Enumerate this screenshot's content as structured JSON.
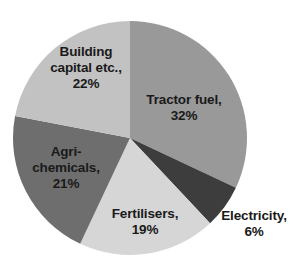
{
  "chart_data": {
    "type": "pie",
    "title": "",
    "subtitle": "",
    "xlabel": "",
    "ylabel": "",
    "legend_position": "none",
    "grid": false,
    "units": "percent",
    "start_angle_deg": 0,
    "direction": "clockwise",
    "categories": [
      "Tractor fuel",
      "Electricity",
      "Fertilisers",
      "Agri-chemicals",
      "Building capital etc."
    ],
    "values": [
      32,
      6,
      19,
      21,
      22
    ],
    "total": 100,
    "slices": [
      {
        "name": "tractor-fuel",
        "label_text": "Tractor fuel,\n32%",
        "category": "Tractor fuel",
        "value": 32,
        "value_text": "32%",
        "color": "#999999",
        "start_deg": 0,
        "end_deg": 115.2,
        "label_inside": true
      },
      {
        "name": "electricity",
        "label_text": "Electricity,\n6%",
        "category": "Electricity",
        "value": 6,
        "value_text": "6%",
        "color": "#3d3d3d",
        "start_deg": 115.2,
        "end_deg": 136.8,
        "label_inside": false
      },
      {
        "name": "fertilisers",
        "label_text": "Fertilisers,\n19%",
        "category": "Fertilisers",
        "value": 19,
        "value_text": "19%",
        "color": "#d6d6d6",
        "start_deg": 136.8,
        "end_deg": 205.2,
        "label_inside": true
      },
      {
        "name": "agri-chemicals",
        "label_text": "Agri-\nchemicals,\n21%",
        "category": "Agri-chemicals",
        "value": 21,
        "value_text": "21%",
        "color": "#6e6e6e",
        "start_deg": 205.2,
        "end_deg": 280.8,
        "label_inside": true
      },
      {
        "name": "building-capital",
        "label_text": "Building\ncapital etc.,\n22%",
        "category": "Building capital etc.",
        "value": 22,
        "value_text": "22%",
        "color": "#c2c2c2",
        "start_deg": 280.8,
        "end_deg": 360,
        "label_inside": true
      }
    ],
    "background_color": "#ffffff",
    "label_color": "#1a1a1a"
  }
}
